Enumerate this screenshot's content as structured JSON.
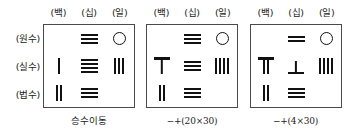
{
  "figure": {
    "kind": "counting-rod-numeral-grids",
    "column_headers": [
      "(백)",
      "(십)",
      "(일)"
    ],
    "row_labels": [
      "(원수)",
      "(실수)",
      "(법수)"
    ]
  },
  "panels": [
    {
      "id": "panel-multiplier-shift",
      "caption": "승수이동",
      "rows": [
        {
          "label": "(원수)",
          "cells": [
            {
              "glyph": "empty",
              "count": 0
            },
            {
              "glyph": "horiz",
              "count": 3
            },
            {
              "glyph": "circle",
              "count": 0
            }
          ]
        },
        {
          "label": "(실수)",
          "cells": [
            {
              "glyph": "vert",
              "count": 1
            },
            {
              "glyph": "horiz",
              "count": 4
            },
            {
              "glyph": "vert",
              "count": 3
            }
          ]
        },
        {
          "label": "(법수)",
          "cells": [
            {
              "glyph": "vert",
              "count": 2
            },
            {
              "glyph": "horiz",
              "count": 3
            },
            {
              "glyph": "empty",
              "count": 0
            }
          ]
        }
      ]
    },
    {
      "id": "panel-subtract-add-20x30",
      "caption": "−+(20×30)",
      "rows": [
        {
          "label": "(원수)",
          "cells": [
            {
              "glyph": "empty",
              "count": 0
            },
            {
              "glyph": "horiz",
              "count": 3
            },
            {
              "glyph": "circle",
              "count": 0
            }
          ]
        },
        {
          "label": "(실수)",
          "cells": [
            {
              "glyph": "tee",
              "count": 1
            },
            {
              "glyph": "horiz",
              "count": 3
            },
            {
              "glyph": "vert",
              "count": 4
            }
          ]
        },
        {
          "label": "(법수)",
          "cells": [
            {
              "glyph": "vert",
              "count": 2
            },
            {
              "glyph": "horiz",
              "count": 3
            },
            {
              "glyph": "empty",
              "count": 0
            }
          ]
        }
      ]
    },
    {
      "id": "panel-subtract-add-4x30",
      "caption": "−+(4×30)",
      "rows": [
        {
          "label": "(원수)",
          "cells": [
            {
              "glyph": "empty",
              "count": 0
            },
            {
              "glyph": "horiz",
              "count": 2
            },
            {
              "glyph": "circle",
              "count": 0
            }
          ]
        },
        {
          "label": "(실수)",
          "cells": [
            {
              "glyph": "tee-double",
              "count": 2
            },
            {
              "glyph": "uptack",
              "count": 1
            },
            {
              "glyph": "vert",
              "count": 4
            }
          ]
        },
        {
          "label": "(법수)",
          "cells": [
            {
              "glyph": "vert",
              "count": 2
            },
            {
              "glyph": "horiz",
              "count": 3
            },
            {
              "glyph": "empty",
              "count": 0
            }
          ]
        }
      ]
    }
  ]
}
